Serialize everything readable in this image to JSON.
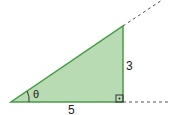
{
  "diagram": {
    "type": "right-triangle",
    "labels": {
      "angle": "θ",
      "adjacent": "5",
      "opposite": "3"
    },
    "colors": {
      "fill": "#b9dbb4",
      "stroke": "#4a9a48",
      "dash": "#555555"
    }
  }
}
